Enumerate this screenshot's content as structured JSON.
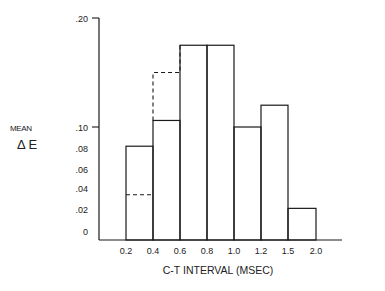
{
  "chart_data": {
    "type": "bar",
    "title": "",
    "xlabel": "C-T INTERVAL (MSEC)",
    "ylabel_line1": "MEAN",
    "ylabel_line2": "Δ E",
    "x_tick_labels": [
      "0.2",
      "0.4",
      "0.6",
      "0.8",
      "1.0",
      "1.2",
      "1.5",
      "2.0"
    ],
    "y_tick_labels": [
      {
        "label": ".20",
        "value": 0.2,
        "tick": true
      },
      {
        "label": ".10",
        "value": 0.1,
        "tick": true
      },
      {
        "label": ".08",
        "value": 0.08,
        "tick": false
      },
      {
        "label": ".06",
        "value": 0.06,
        "tick": false
      },
      {
        "label": ".04",
        "value": 0.04,
        "tick": false
      },
      {
        "label": ".02",
        "value": 0.02,
        "tick": false
      },
      {
        "label": "0",
        "value": 0.0,
        "tick": false
      }
    ],
    "ylim": [
      0,
      0.2
    ],
    "y_scale_note": "nonuniform: 0-.10 expanded, .10-.20 compressed",
    "bins": [
      {
        "from": "0.2",
        "to": "0.4"
      },
      {
        "from": "0.4",
        "to": "0.6"
      },
      {
        "from": "0.6",
        "to": "0.8"
      },
      {
        "from": "0.8",
        "to": "1.0"
      },
      {
        "from": "1.0",
        "to": "1.2"
      },
      {
        "from": "1.2",
        "to": "1.5"
      },
      {
        "from": "1.5",
        "to": "2.0"
      }
    ],
    "series": [
      {
        "name": "solid",
        "style": "solid",
        "values": [
          0.083,
          0.106,
          0.175,
          0.175,
          0.1,
          0.12,
          0.028
        ]
      },
      {
        "name": "dashed",
        "style": "dashed",
        "values": [
          0.04,
          0.15,
          null,
          null,
          null,
          null,
          null
        ]
      }
    ],
    "grid": false,
    "legend": "none",
    "colors": {
      "line": "#1a1a1a",
      "background": "#ffffff"
    }
  }
}
